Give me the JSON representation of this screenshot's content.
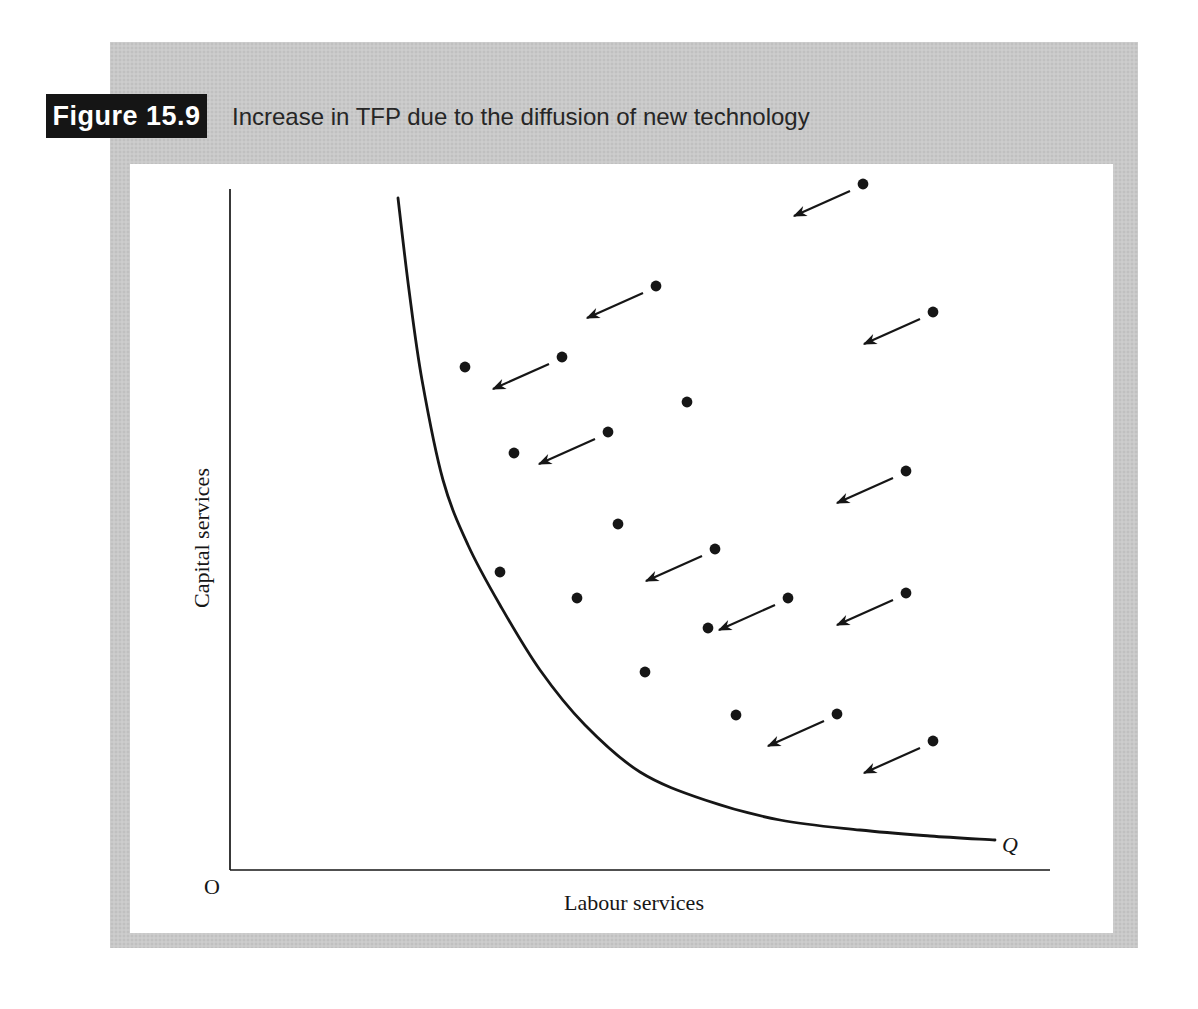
{
  "header": {
    "figure_label": "Figure 15.9",
    "title": "Increase in TFP due to the diffusion of new technology"
  },
  "chart_data": {
    "type": "scatter",
    "title": "Increase in TFP due to the diffusion of new technology",
    "xlabel": "Labour services",
    "ylabel": "Capital services",
    "origin_label": "O",
    "units": "screenshot pixels (qualitative diagram, no numeric axis scale)",
    "axes_px": {
      "origin": [
        230,
        870
      ],
      "y_axis_top": 189,
      "x_axis_right": 1050
    },
    "isoquant": {
      "label": "Q",
      "points_px": [
        [
          398,
          198
        ],
        [
          409,
          290
        ],
        [
          422,
          380
        ],
        [
          443,
          480
        ],
        [
          468,
          545
        ],
        [
          500,
          605
        ],
        [
          540,
          670
        ],
        [
          585,
          725
        ],
        [
          640,
          772
        ],
        [
          705,
          800
        ],
        [
          780,
          820
        ],
        [
          860,
          830
        ],
        [
          930,
          836
        ],
        [
          995,
          840
        ]
      ]
    },
    "firms": [
      {
        "x": 863,
        "y": 184,
        "arrow": true
      },
      {
        "x": 656,
        "y": 286,
        "arrow": true
      },
      {
        "x": 933,
        "y": 312,
        "arrow": true
      },
      {
        "x": 465,
        "y": 367,
        "arrow": false
      },
      {
        "x": 562,
        "y": 357,
        "arrow": true
      },
      {
        "x": 687,
        "y": 402,
        "arrow": false
      },
      {
        "x": 608,
        "y": 432,
        "arrow": true
      },
      {
        "x": 514,
        "y": 453,
        "arrow": false
      },
      {
        "x": 906,
        "y": 471,
        "arrow": true
      },
      {
        "x": 618,
        "y": 524,
        "arrow": false
      },
      {
        "x": 715,
        "y": 549,
        "arrow": true
      },
      {
        "x": 500,
        "y": 572,
        "arrow": false
      },
      {
        "x": 577,
        "y": 598,
        "arrow": false
      },
      {
        "x": 788,
        "y": 598,
        "arrow": true
      },
      {
        "x": 906,
        "y": 593,
        "arrow": true
      },
      {
        "x": 708,
        "y": 628,
        "arrow": false
      },
      {
        "x": 645,
        "y": 672,
        "arrow": false
      },
      {
        "x": 736,
        "y": 715,
        "arrow": false
      },
      {
        "x": 837,
        "y": 714,
        "arrow": true
      },
      {
        "x": 933,
        "y": 741,
        "arrow": true
      }
    ],
    "arrow_style": {
      "tail_offset": [
        -13,
        7
      ],
      "vector": [
        -56,
        25
      ]
    },
    "legend": "off",
    "grid": "off"
  },
  "colors": {
    "band_background": "#c9c9c9",
    "panel_background": "#ffffff",
    "figure_label_background": "#151515",
    "figure_label_text": "#ffffff",
    "ink": "#161616"
  }
}
